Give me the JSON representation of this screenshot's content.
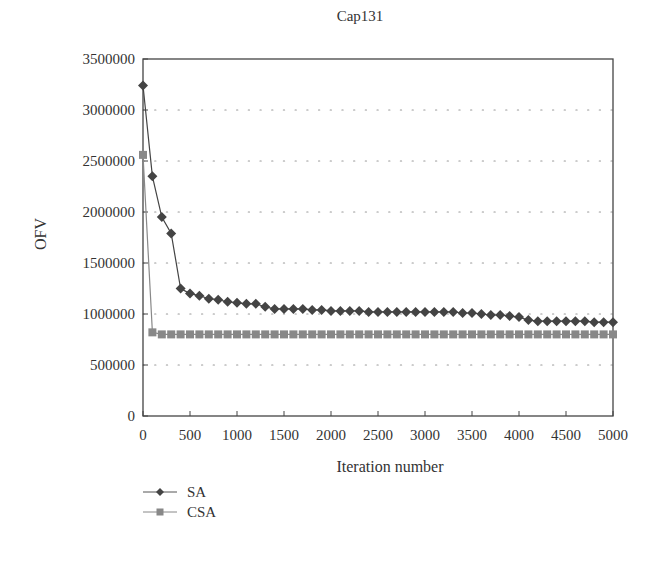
{
  "chart_data": {
    "type": "line",
    "title": "Cap131",
    "xlabel": "Iteration number",
    "ylabel": "OFV",
    "xlim": [
      0,
      5000
    ],
    "ylim": [
      0,
      3500000
    ],
    "x_ticks": [
      0,
      500,
      1000,
      1500,
      2000,
      2500,
      3000,
      3500,
      4000,
      4500,
      5000
    ],
    "y_ticks": [
      0,
      500000,
      1000000,
      1500000,
      2000000,
      2500000,
      3000000,
      3500000
    ],
    "y_tick_labels": [
      "0",
      "500000",
      "1000000",
      "1500000",
      "2000000",
      "2500000",
      "3000000",
      "3500000"
    ],
    "x_tick_labels": [
      "0",
      "500",
      "1000",
      "1500",
      "2000",
      "2500",
      "3000",
      "3500",
      "4000",
      "4500",
      "5000"
    ],
    "grid": "horizontal dotted",
    "legend_position": "below-left",
    "x": [
      0,
      100,
      200,
      300,
      400,
      500,
      600,
      700,
      800,
      900,
      1000,
      1100,
      1200,
      1300,
      1400,
      1500,
      1600,
      1700,
      1800,
      1900,
      2000,
      2100,
      2200,
      2300,
      2400,
      2500,
      2600,
      2700,
      2800,
      2900,
      3000,
      3100,
      3200,
      3300,
      3400,
      3500,
      3600,
      3700,
      3800,
      3900,
      4000,
      4100,
      4200,
      4300,
      4400,
      4500,
      4600,
      4700,
      4800,
      4900,
      5000
    ],
    "series": [
      {
        "name": "SA",
        "marker": "diamond",
        "color": "#444444",
        "values": [
          3240000,
          2350000,
          1950000,
          1790000,
          1250000,
          1200000,
          1180000,
          1150000,
          1140000,
          1120000,
          1110000,
          1100000,
          1100000,
          1070000,
          1050000,
          1050000,
          1050000,
          1050000,
          1040000,
          1040000,
          1030000,
          1030000,
          1030000,
          1030000,
          1020000,
          1020000,
          1020000,
          1020000,
          1020000,
          1020000,
          1020000,
          1020000,
          1020000,
          1020000,
          1010000,
          1010000,
          1000000,
          990000,
          990000,
          980000,
          970000,
          940000,
          930000,
          930000,
          930000,
          930000,
          930000,
          930000,
          920000,
          920000,
          920000
        ]
      },
      {
        "name": "CSA",
        "marker": "square",
        "color": "#888888",
        "values": [
          2560000,
          820000,
          800000,
          800000,
          800000,
          800000,
          800000,
          800000,
          800000,
          800000,
          800000,
          800000,
          800000,
          800000,
          800000,
          800000,
          800000,
          800000,
          800000,
          800000,
          800000,
          800000,
          800000,
          800000,
          800000,
          800000,
          800000,
          800000,
          800000,
          800000,
          800000,
          800000,
          800000,
          800000,
          800000,
          800000,
          800000,
          800000,
          800000,
          800000,
          800000,
          800000,
          800000,
          800000,
          800000,
          800000,
          800000,
          800000,
          800000,
          800000,
          800000
        ]
      }
    ]
  },
  "legend": {
    "items": [
      {
        "label": "SA"
      },
      {
        "label": "CSA"
      }
    ]
  }
}
